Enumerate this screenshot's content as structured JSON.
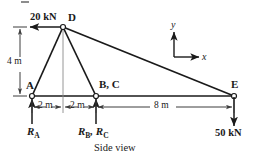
{
  "figure": {
    "caption": "Side view",
    "nodes": [
      {
        "id": "A",
        "label": "A",
        "x": 32,
        "y": 96
      },
      {
        "id": "BC",
        "label": "B, C",
        "x": 96,
        "y": 96
      },
      {
        "id": "D",
        "label": "D",
        "x": 63,
        "y": 27
      },
      {
        "id": "E",
        "label": "E",
        "x": 234,
        "y": 96
      }
    ],
    "members": [
      {
        "from": "A",
        "to": "D"
      },
      {
        "from": "D",
        "to": "BC"
      },
      {
        "from": "D",
        "to": "E"
      },
      {
        "from": "A",
        "to": "E"
      }
    ],
    "loads": [
      {
        "name": "applied-load-20kn",
        "label": "20 kN",
        "magnitude": 20,
        "unit": "kN",
        "direction": "left",
        "at": "D"
      },
      {
        "name": "applied-load-50kn",
        "label": "50 kN",
        "magnitude": 50,
        "unit": "kN",
        "direction": "down",
        "at": "E"
      }
    ],
    "reactions": [
      {
        "name": "reaction-a",
        "symbol": "R",
        "subscript": "A",
        "direction": "up",
        "at": "A"
      },
      {
        "name": "reaction-bc",
        "symbol_1": "R",
        "subscript_1": "B",
        "symbol_2": "R",
        "subscript_2": "C",
        "direction": "up",
        "at": "BC"
      }
    ],
    "dimensions": [
      {
        "name": "dim-vertical-4m",
        "label": "4 m",
        "value": 4,
        "unit": "m",
        "orientation": "vertical"
      },
      {
        "name": "dim-a-to-bc-first",
        "label": "2 m",
        "value": 2,
        "unit": "m",
        "orientation": "horizontal"
      },
      {
        "name": "dim-a-to-bc-second",
        "label": "2 m",
        "value": 2,
        "unit": "m",
        "orientation": "horizontal"
      },
      {
        "name": "dim-bc-to-e",
        "label": "8 m",
        "value": 8,
        "unit": "m",
        "orientation": "horizontal"
      }
    ],
    "axes": {
      "x_label": "x",
      "y_label": "y",
      "origin_x": 174,
      "origin_y": 57
    },
    "colors": {
      "line": "#1a1a1a",
      "dimension": "#4a4a4a",
      "background": "#ffffff"
    }
  }
}
